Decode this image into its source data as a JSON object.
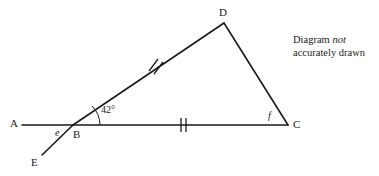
{
  "figure": {
    "stroke_color": "#1a1a1a",
    "background_color": "#ffffff"
  },
  "vertices": [
    {
      "name": "A",
      "label": "A",
      "x": 22,
      "y": 125
    },
    {
      "name": "B",
      "label": "B",
      "x": 73,
      "y": 125
    },
    {
      "name": "C",
      "label": "C",
      "x": 288,
      "y": 125
    },
    {
      "name": "D",
      "label": "D",
      "x": 224,
      "y": 23
    },
    {
      "name": "E",
      "label": "E",
      "x": 42,
      "y": 155
    }
  ],
  "segments": [
    {
      "name": "segment-A-C",
      "from": "A",
      "to": "C",
      "ticks": 0
    },
    {
      "name": "segment-B-D",
      "from": "B",
      "to": "D",
      "ticks": 2
    },
    {
      "name": "segment-D-C",
      "from": "D",
      "to": "C",
      "ticks": 0
    },
    {
      "name": "segment-B-E",
      "from": "B",
      "to": "E",
      "ticks": 0
    }
  ],
  "tick_marks": [
    {
      "name": "tick-mark-BD",
      "segment": "segment-B-D",
      "count": 2
    },
    {
      "name": "tick-mark-BC",
      "segment": "segment-A-C",
      "count": 2
    }
  ],
  "angles": [
    {
      "name": "angle-DBC",
      "label": "42°",
      "value": "42",
      "unit": "degrees",
      "at_vertex": "B",
      "arc": true
    },
    {
      "name": "angle-ABE",
      "label": "e",
      "italic": true,
      "at_vertex": "B",
      "arc": false
    },
    {
      "name": "angle-DCB",
      "label": "f",
      "italic": true,
      "at_vertex": "C",
      "arc": false
    }
  ],
  "note": {
    "line1_prefix": "Diagram ",
    "line1_italic": "not",
    "line2": "accurately drawn"
  }
}
